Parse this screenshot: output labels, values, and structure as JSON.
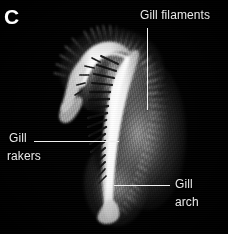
{
  "figure": {
    "panel_letter": "C",
    "background_color": "#000000",
    "label_color": "#e9e9e9",
    "leader_color": "#f2f2f2",
    "specimen": {
      "name": "fish-gill-arch-micrograph",
      "description": "Dissected gill arch showing gill rakers and gill filaments",
      "highlight_color": "#ffffff",
      "tissue_color": "#9a9a9a"
    },
    "annotations": [
      {
        "id": "gill-filaments",
        "text": "Gill filaments",
        "lines": [
          "Gill filaments"
        ],
        "label_x": 140,
        "label_y": 9,
        "leader": {
          "orientation": "vertical",
          "x": 147,
          "y1": 28,
          "y2": 110
        }
      },
      {
        "id": "gill-rakers",
        "text": "Gill rakers",
        "lines": [
          "Gill",
          "rakers"
        ],
        "label_x": 8,
        "label_y": 132,
        "leader": {
          "orientation": "horizontal",
          "y": 141,
          "x1": 34,
          "x2": 119
        }
      },
      {
        "id": "gill-arch",
        "text": "Gill arch",
        "lines": [
          "Gill",
          "arch"
        ],
        "label_x": 175,
        "label_y": 178,
        "leader": {
          "orientation": "horizontal",
          "y": 185,
          "x1": 114,
          "x2": 170
        }
      }
    ]
  }
}
